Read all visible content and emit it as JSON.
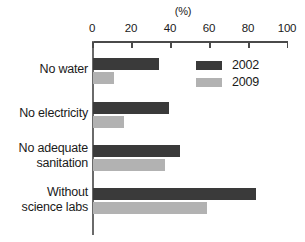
{
  "chart_data": {
    "type": "bar",
    "orientation": "horizontal",
    "title": "",
    "xlabel": "(%)",
    "ylabel": "",
    "xlim": [
      0,
      100
    ],
    "xticks": [
      0,
      20,
      40,
      60,
      80,
      100
    ],
    "grid": false,
    "legend_position": "top-right-inside",
    "categories": [
      "No water",
      "No electricity",
      "No adequate sanitation",
      "Without science labs"
    ],
    "category_lines": [
      [
        "No water"
      ],
      [
        "No electricity"
      ],
      [
        "No adequate",
        "sanitation"
      ],
      [
        "Without",
        "science labs"
      ]
    ],
    "series": [
      {
        "name": "2002",
        "color": "#3a3a3a",
        "values": [
          34,
          39,
          45,
          84
        ]
      },
      {
        "name": "2009",
        "color": "#b2b2b2",
        "values": [
          11,
          16,
          37,
          59
        ]
      }
    ]
  },
  "axis": {
    "unit_label": "(%)",
    "tick_labels": [
      "0",
      "20",
      "40",
      "60",
      "80",
      "100"
    ]
  },
  "legend": {
    "entries": [
      {
        "label": "2002"
      },
      {
        "label": "2009"
      }
    ]
  }
}
